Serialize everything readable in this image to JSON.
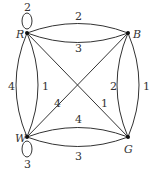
{
  "diagram": {
    "type": "multigraph",
    "vertices": [
      {
        "id": "R",
        "label": "R"
      },
      {
        "id": "B",
        "label": "B"
      },
      {
        "id": "W",
        "label": "W"
      },
      {
        "id": "G",
        "label": "G"
      }
    ],
    "edges": [
      {
        "from": "R",
        "to": "R",
        "weight": "2",
        "kind": "loop"
      },
      {
        "from": "R",
        "to": "B",
        "weight": "2",
        "kind": "upper-arc"
      },
      {
        "from": "R",
        "to": "B",
        "weight": "3",
        "kind": "lower-arc"
      },
      {
        "from": "R",
        "to": "W",
        "weight": "4",
        "kind": "left-arc"
      },
      {
        "from": "R",
        "to": "W",
        "weight": "1",
        "kind": "right-arc"
      },
      {
        "from": "R",
        "to": "G",
        "weight": "1",
        "kind": "diagonal"
      },
      {
        "from": "B",
        "to": "W",
        "weight": "4",
        "kind": "diagonal"
      },
      {
        "from": "B",
        "to": "G",
        "weight": "2",
        "kind": "left-arc"
      },
      {
        "from": "B",
        "to": "G",
        "weight": "1",
        "kind": "right-arc"
      },
      {
        "from": "W",
        "to": "G",
        "weight": "4",
        "kind": "upper-arc"
      },
      {
        "from": "W",
        "to": "G",
        "weight": "3",
        "kind": "lower-arc"
      },
      {
        "from": "W",
        "to": "W",
        "weight": "3",
        "kind": "loop"
      }
    ]
  }
}
